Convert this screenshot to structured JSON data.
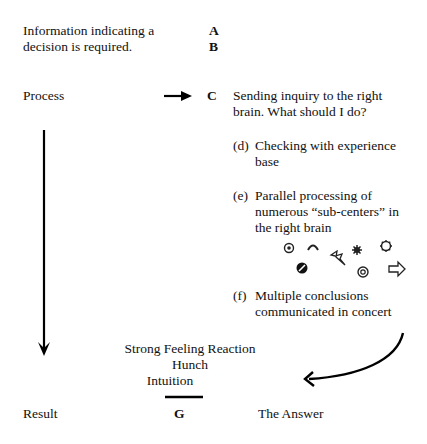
{
  "input": {
    "label_line1": "Information indicating a",
    "label_line2": "decision is required.",
    "marker_a": "A",
    "marker_b": "B"
  },
  "process": {
    "label": "Process",
    "marker_c": "C",
    "c_text_line1": "Sending inquiry to the right",
    "c_text_line2": "brain. What should I do?",
    "steps": [
      {
        "marker": "(d)",
        "lines": [
          "Checking with experience",
          "base"
        ]
      },
      {
        "marker": "(e)",
        "lines": [
          "Parallel processing of",
          "numerous “sub-centers” in",
          "the right brain"
        ]
      },
      {
        "marker": "(f)",
        "lines": [
          "Multiple conclusions",
          "communicated in concert"
        ]
      }
    ],
    "sub_center_icons": [
      "target-icon",
      "arc-icon",
      "lightning-icon",
      "gear-icon",
      "sun-icon",
      "no-entry-icon",
      "target-icon",
      "arrow-right-outline-icon"
    ]
  },
  "output": {
    "feeling_line1": "Strong Feeling Reaction",
    "feeling_line2": "Hunch",
    "feeling_line3": "Intuition",
    "result_label": "Result",
    "marker_g": "G",
    "answer": "The Answer"
  }
}
